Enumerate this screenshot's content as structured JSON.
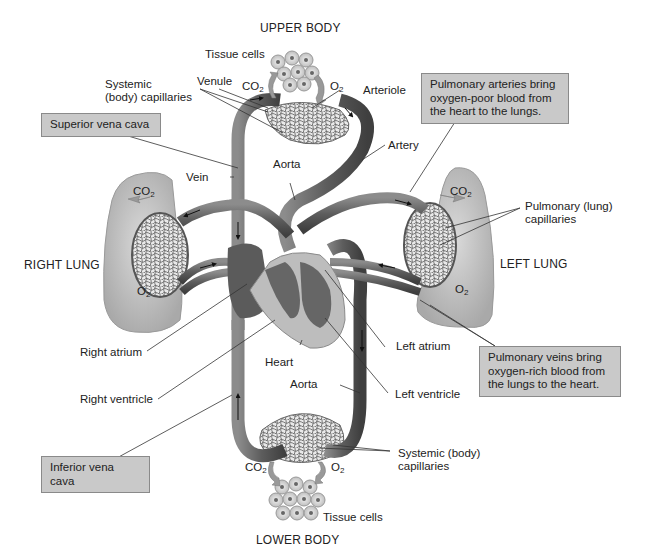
{
  "figure": {
    "type": "anatomical-diagram"
  },
  "regions": {
    "upper_body": "UPPER BODY",
    "lower_body": "LOWER BODY",
    "right_lung": "RIGHT LUNG",
    "left_lung": "LEFT LUNG"
  },
  "labels": {
    "tissue_cells_top": "Tissue cells",
    "tissue_cells_bottom": "Tissue cells",
    "systemic_capillaries_top_l1": "Systemic",
    "systemic_capillaries_top_l2": "(body) capillaries",
    "venule": "Venule",
    "arteriole": "Arteriole",
    "artery": "Artery",
    "aorta_top": "Aorta",
    "vein": "Vein",
    "pulmonary_capillaries_l1": "Pulmonary (lung)",
    "pulmonary_capillaries_l2": "capillaries",
    "right_atrium": "Right atrium",
    "right_ventricle": "Right ventricle",
    "heart": "Heart",
    "aorta_bottom": "Aorta",
    "left_atrium": "Left atrium",
    "left_ventricle": "Left ventricle",
    "systemic_capillaries_bottom_l1": "Systemic (body)",
    "systemic_capillaries_bottom_l2": "capillaries"
  },
  "gases": {
    "co2": "CO",
    "o2": "O",
    "subscript": "2"
  },
  "callouts": {
    "superior_vena_cava": "Superior vena cava",
    "inferior_vena_cava": "Inferior vena cava",
    "pulmonary_arteries_l1": "Pulmonary arteries bring",
    "pulmonary_arteries_l2": "oxygen-poor blood from",
    "pulmonary_arteries_l3": "the heart to the lungs.",
    "pulmonary_veins_l1": "Pulmonary veins bring",
    "pulmonary_veins_l2": "oxygen-rich blood from",
    "pulmonary_veins_l3": "the lungs to the heart."
  },
  "colors": {
    "vessel_dark": "#555555",
    "vessel_mid": "#7a7a7a",
    "vessel_light": "#9a9a9a",
    "lung_fill": "#c8c8c8",
    "heart_light": "#bdbdbd",
    "callout_bg": "#c9c9c9",
    "leader_line": "#333333"
  }
}
